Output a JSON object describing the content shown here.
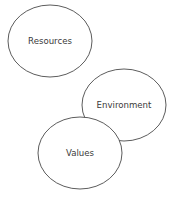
{
  "diagram": {
    "type": "bubble-diagram",
    "nodes": [
      {
        "id": "resources",
        "label": "Resources",
        "cx": 50,
        "cy": 41,
        "rx": 42,
        "ry": 36
      },
      {
        "id": "environment",
        "label": "Environment",
        "cx": 124,
        "cy": 105,
        "rx": 42,
        "ry": 36
      },
      {
        "id": "values",
        "label": "Values",
        "cx": 80,
        "cy": 153,
        "rx": 42,
        "ry": 36
      }
    ],
    "stroke_color": "#4a4a4a",
    "fill_color": "#ffffff",
    "text_color": "#3a3a3a"
  }
}
